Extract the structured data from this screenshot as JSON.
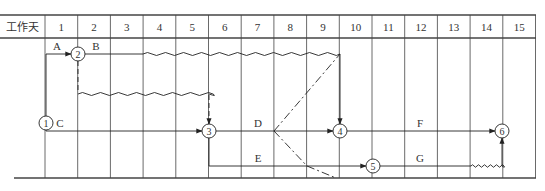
{
  "header": {
    "row_label": "工作天",
    "days": [
      "1",
      "2",
      "3",
      "4",
      "5",
      "6",
      "7",
      "8",
      "9",
      "10",
      "11",
      "12",
      "13",
      "14",
      "15"
    ]
  },
  "nodes": [
    {
      "id": "1",
      "x": 46,
      "y": 123
    },
    {
      "id": "2",
      "x": 78,
      "y": 54
    },
    {
      "id": "3",
      "x": 209,
      "y": 131
    },
    {
      "id": "4",
      "x": 340,
      "y": 131
    },
    {
      "id": "5",
      "x": 373,
      "y": 166
    },
    {
      "id": "6",
      "x": 502,
      "y": 131
    }
  ],
  "activities": [
    {
      "name": "A",
      "label_x": 57,
      "label_y": 50
    },
    {
      "name": "B",
      "label_x": 96,
      "label_y": 50
    },
    {
      "name": "C",
      "label_x": 60,
      "label_y": 127
    },
    {
      "name": "D",
      "label_x": 258,
      "label_y": 127
    },
    {
      "name": "E",
      "label_x": 258,
      "label_y": 162
    },
    {
      "name": "F",
      "label_x": 420,
      "label_y": 127
    },
    {
      "name": "G",
      "label_x": 420,
      "label_y": 162
    }
  ],
  "colors": {
    "line": "#333333",
    "grid": "#444444",
    "background": "#ffffff"
  }
}
